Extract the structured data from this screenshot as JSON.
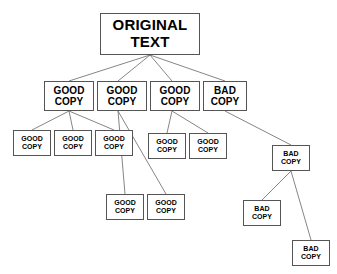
{
  "diagram": {
    "background_color": "#ffffff",
    "box_border_color": "#555555",
    "edge_color": "#777777",
    "text_color": "#000000",
    "labels": {
      "original_line1": "ORIGINAL",
      "original_line2": "TEXT",
      "good_line1": "GOOD",
      "good_line2": "COPY",
      "bad_line1": "BAD",
      "bad_line2": "COPY"
    },
    "nodes": [
      {
        "id": "root",
        "line1": "ORIGINAL",
        "line2": "TEXT",
        "kind": "original",
        "size": "root",
        "x": 100,
        "y": 13,
        "w": 100,
        "h": 42
      },
      {
        "id": "n2a",
        "line1": "GOOD",
        "line2": "COPY",
        "kind": "good",
        "size": "mid",
        "x": 44,
        "y": 81,
        "w": 50,
        "h": 30
      },
      {
        "id": "n2b",
        "line1": "GOOD",
        "line2": "COPY",
        "kind": "good",
        "size": "mid",
        "x": 97,
        "y": 81,
        "w": 50,
        "h": 30
      },
      {
        "id": "n2c",
        "line1": "GOOD",
        "line2": "COPY",
        "kind": "good",
        "size": "mid",
        "x": 150,
        "y": 81,
        "w": 50,
        "h": 30
      },
      {
        "id": "n2d",
        "line1": "BAD",
        "line2": "COPY",
        "kind": "bad",
        "size": "mid",
        "x": 203,
        "y": 81,
        "w": 44,
        "h": 30
      },
      {
        "id": "n3a",
        "line1": "GOOD",
        "line2": "COPY",
        "kind": "good",
        "size": "small",
        "x": 13,
        "y": 130,
        "w": 38,
        "h": 26
      },
      {
        "id": "n3b",
        "line1": "GOOD",
        "line2": "COPY",
        "kind": "good",
        "size": "small",
        "x": 54,
        "y": 130,
        "w": 38,
        "h": 26
      },
      {
        "id": "n3c",
        "line1": "GOOD",
        "line2": "COPY",
        "kind": "good",
        "size": "small",
        "x": 95,
        "y": 130,
        "w": 38,
        "h": 26
      },
      {
        "id": "n3d",
        "line1": "GOOD",
        "line2": "COPY",
        "kind": "good",
        "size": "small",
        "x": 148,
        "y": 133,
        "w": 38,
        "h": 26
      },
      {
        "id": "n3e",
        "line1": "GOOD",
        "line2": "COPY",
        "kind": "good",
        "size": "small",
        "x": 189,
        "y": 133,
        "w": 38,
        "h": 26
      },
      {
        "id": "n3f",
        "line1": "BAD",
        "line2": "COPY",
        "kind": "bad",
        "size": "small",
        "x": 272,
        "y": 145,
        "w": 38,
        "h": 26
      },
      {
        "id": "n4a",
        "line1": "GOOD",
        "line2": "COPY",
        "kind": "good",
        "size": "small",
        "x": 106,
        "y": 194,
        "w": 38,
        "h": 26
      },
      {
        "id": "n4b",
        "line1": "GOOD",
        "line2": "COPY",
        "kind": "good",
        "size": "small",
        "x": 147,
        "y": 194,
        "w": 38,
        "h": 26
      },
      {
        "id": "n4c",
        "line1": "BAD",
        "line2": "COPY",
        "kind": "bad",
        "size": "small",
        "x": 243,
        "y": 200,
        "w": 38,
        "h": 26
      },
      {
        "id": "n5a",
        "line1": "BAD",
        "line2": "COPY",
        "kind": "bad",
        "size": "small",
        "x": 292,
        "y": 240,
        "w": 38,
        "h": 26
      }
    ],
    "edges": [
      {
        "from": "root",
        "to": "n2a",
        "x1": 150,
        "y1": 55,
        "x2": 69,
        "y2": 81
      },
      {
        "from": "root",
        "to": "n2b",
        "x1": 150,
        "y1": 55,
        "x2": 118,
        "y2": 81
      },
      {
        "from": "root",
        "to": "n2c",
        "x1": 150,
        "y1": 55,
        "x2": 172,
        "y2": 81
      },
      {
        "from": "root",
        "to": "n2d",
        "x1": 150,
        "y1": 55,
        "x2": 225,
        "y2": 81
      },
      {
        "from": "n2a",
        "to": "n3a",
        "x1": 69,
        "y1": 111,
        "x2": 32,
        "y2": 130
      },
      {
        "from": "n2a",
        "to": "n3b",
        "x1": 69,
        "y1": 111,
        "x2": 73,
        "y2": 130
      },
      {
        "from": "n2a",
        "to": "n3c",
        "x1": 69,
        "y1": 111,
        "x2": 114,
        "y2": 130
      },
      {
        "from": "n2b",
        "to": "n4a",
        "x1": 118,
        "y1": 111,
        "x2": 125,
        "y2": 194
      },
      {
        "from": "n2b",
        "to": "n4b",
        "x1": 118,
        "y1": 111,
        "x2": 166,
        "y2": 194
      },
      {
        "from": "n2c",
        "to": "n3d",
        "x1": 172,
        "y1": 111,
        "x2": 167,
        "y2": 133
      },
      {
        "from": "n2c",
        "to": "n3e",
        "x1": 172,
        "y1": 111,
        "x2": 208,
        "y2": 133
      },
      {
        "from": "n2d",
        "to": "n3f",
        "x1": 225,
        "y1": 111,
        "x2": 291,
        "y2": 145
      },
      {
        "from": "n3f",
        "to": "n4c",
        "x1": 291,
        "y1": 171,
        "x2": 262,
        "y2": 200
      },
      {
        "from": "n3f",
        "to": "n5a",
        "x1": 291,
        "y1": 171,
        "x2": 311,
        "y2": 240
      }
    ]
  }
}
